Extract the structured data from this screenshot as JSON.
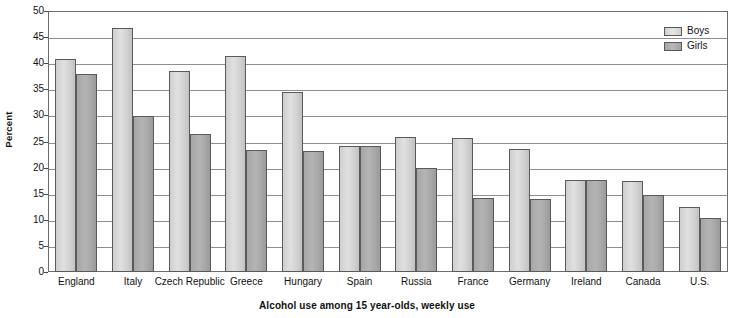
{
  "chart_data": {
    "type": "bar",
    "title": "Alcohol use among 15 year-olds, weekly use",
    "xlabel": "",
    "ylabel": "Percent",
    "ylim": [
      0,
      50
    ],
    "ytick_step": 5,
    "yticks": [
      0,
      5,
      10,
      15,
      20,
      25,
      30,
      35,
      40,
      45,
      50
    ],
    "grid": true,
    "legend_position": "top-right",
    "categories": [
      "England",
      "Italy",
      "Czech Republic",
      "Greece",
      "Hungary",
      "Spain",
      "Russia",
      "France",
      "Germany",
      "Ireland",
      "Canada",
      "U.S."
    ],
    "series": [
      {
        "name": "Boys",
        "color": "#d6d6d6",
        "values": [
          40.9,
          46.8,
          38.6,
          41.4,
          34.5,
          24.1,
          25.8,
          25.6,
          23.5,
          17.7,
          17.4,
          12.4
        ]
      },
      {
        "name": "Girls",
        "color": "#a8a8a8",
        "values": [
          37.9,
          29.8,
          26.4,
          23.4,
          23.1,
          24.1,
          19.9,
          14.2,
          13.9,
          17.6,
          14.7,
          10.3
        ]
      }
    ]
  },
  "axis": {
    "y_title": "Percent"
  },
  "caption": {
    "text": "Alcohol use among 15 year-olds, weekly use"
  },
  "legend": {
    "items": [
      {
        "label": "Boys"
      },
      {
        "label": "Girls"
      }
    ]
  }
}
